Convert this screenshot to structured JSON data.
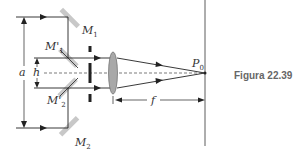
{
  "figure": {
    "caption": "Figura 22.39",
    "labels": {
      "a": "a",
      "h": "h",
      "f": "f",
      "M1": "M",
      "M1_sub": "1",
      "M1p": "M'",
      "M1p_sub": "1",
      "M2p": "M'",
      "M2p_sub": "2",
      "M2": "M",
      "M2_sub": "2",
      "P0": "P",
      "P0_sub": "0"
    },
    "colors": {
      "line": "#222222",
      "mirror": "#c8c8c8",
      "lens": "#a8a8a8",
      "caption": "#666666"
    }
  }
}
